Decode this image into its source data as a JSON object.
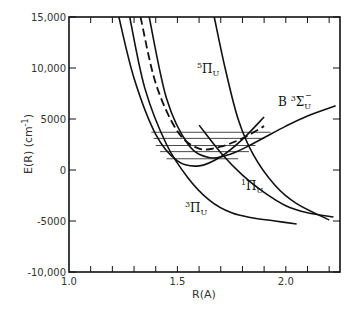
{
  "chart_data": {
    "type": "line",
    "title": "",
    "xlabel": "R(A)",
    "ylabel": "E(R) (cm⁻¹)",
    "xlim": [
      1.0,
      2.25
    ],
    "ylim": [
      -10000,
      15000
    ],
    "grid": false,
    "legend": "none (curves labeled inline)",
    "x_ticks": [
      1.0,
      1.5,
      2.0
    ],
    "x_tick_labels": [
      "1.0",
      "1.5",
      "2.0"
    ],
    "y_ticks": [
      15000,
      10000,
      5000,
      0,
      -5000,
      -10000
    ],
    "y_tick_labels": [
      "15,000",
      "10,000",
      "5000",
      "0",
      "-5000",
      "-10,000"
    ],
    "series": [
      {
        "name": "X (ground state, unlabeled)",
        "style": "solid",
        "x": [
          1.23,
          1.3,
          1.4,
          1.5,
          1.6,
          1.7,
          1.8,
          1.9
        ],
        "y": [
          15000,
          9000,
          3500,
          900,
          400,
          1300,
          3000,
          5200
        ]
      },
      {
        "name": "B 3Σu-",
        "label": "B ³Σu⁻",
        "style": "dashed",
        "x": [
          1.33,
          1.4,
          1.5,
          1.6,
          1.7,
          1.8,
          1.9
        ],
        "y": [
          15000,
          8500,
          3800,
          2100,
          2300,
          3100,
          4300
        ]
      },
      {
        "name": "B 3Σu- (solid continuation)",
        "style": "solid",
        "x": [
          1.37,
          1.45,
          1.55,
          1.65,
          1.75,
          1.85,
          2.0,
          2.1,
          2.23
        ],
        "y": [
          15000,
          7000,
          2500,
          1200,
          1600,
          2600,
          4300,
          5300,
          6300
        ]
      },
      {
        "name": "5Πu",
        "label": "⁵Πu",
        "style": "solid",
        "x": [
          1.67,
          1.72,
          1.78,
          1.85,
          1.95,
          2.05,
          2.2
        ],
        "y": [
          15000,
          10000,
          5000,
          1500,
          -1500,
          -3300,
          -4900
        ]
      },
      {
        "name": "1Πu",
        "label": "¹Πu",
        "style": "solid",
        "x": [
          1.6,
          1.7,
          1.8,
          1.9,
          2.0,
          2.1,
          2.22
        ],
        "y": [
          4400,
          1700,
          -500,
          -2200,
          -3500,
          -4200,
          -4600
        ]
      },
      {
        "name": "3Πu",
        "label": "³Πu",
        "style": "solid",
        "x": [
          1.28,
          1.35,
          1.45,
          1.55,
          1.65,
          1.75,
          1.85,
          1.95,
          2.05
        ],
        "y": [
          15000,
          8000,
          2500,
          -800,
          -3000,
          -4200,
          -4700,
          -5000,
          -5300
        ]
      }
    ],
    "vibrational_levels": {
      "description": "horizontal vibrational level lines inside the ground-state well",
      "levels": [
        {
          "y": 3700,
          "x_start": 1.38,
          "x_end": 1.93
        },
        {
          "y": 3100,
          "x_start": 1.39,
          "x_end": 1.9
        },
        {
          "y": 2400,
          "x_start": 1.4,
          "x_end": 1.86
        },
        {
          "y": 1800,
          "x_start": 1.42,
          "x_end": 1.83
        },
        {
          "y": 1100,
          "x_start": 1.45,
          "x_end": 1.78
        }
      ]
    },
    "annotations": [
      "⁵Πu",
      "B ³Σu⁻",
      "¹Πu",
      "³Πu"
    ]
  },
  "axes": {
    "x_title": "R(A)",
    "y_title": "E(R) (cm",
    "y_title_sup": "-1",
    "y_title_close": ")"
  },
  "labels": {
    "pi5": {
      "sup": "5",
      "main": "Π",
      "sub": "U"
    },
    "b3sigma": {
      "prefix": "B ",
      "sup": "3",
      "main": "Σ",
      "sub": "U",
      "supr": "−"
    },
    "pi1": {
      "sup": "1",
      "main": "Π",
      "sub": "U"
    },
    "pi3": {
      "sup": "3",
      "main": "Π",
      "sub": "U"
    }
  }
}
